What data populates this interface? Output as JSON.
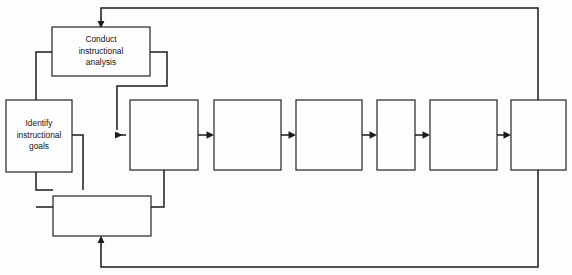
{
  "diagram": {
    "type": "instructional-design-flowchart",
    "background_color": "#fdfdfb",
    "line_color": "#1b1b1b",
    "box_fill_color": "#fefefe",
    "nodes": [
      {
        "id": "conduct-instructional-analysis",
        "label_lines": [
          "Conduct",
          "instructional",
          "analysis"
        ],
        "line1": "Conduct",
        "line2": "instructional",
        "line3": "analysis",
        "x": 52,
        "y": 27,
        "width": 98,
        "height": 49
      },
      {
        "id": "identify-instructional-goals",
        "label_lines": [
          "Identify",
          "instructional",
          "goals"
        ],
        "line1": "Identify",
        "line2": "instructional",
        "line3": "goals",
        "x": 6,
        "y": 100,
        "width": 66,
        "height": 72
      },
      {
        "id": "bottom-box",
        "label_lines": [],
        "line1": "",
        "x": 53,
        "y": 196,
        "width": 98,
        "height": 40
      },
      {
        "id": "process-step-1",
        "label_lines": [],
        "line1": "",
        "x": 130,
        "y": 100,
        "width": 68,
        "height": 70
      },
      {
        "id": "process-step-2",
        "label_lines": [],
        "line1": "",
        "x": 214,
        "y": 100,
        "width": 67,
        "height": 70
      },
      {
        "id": "process-step-3",
        "label_lines": [],
        "line1": "",
        "x": 296,
        "y": 100,
        "width": 66,
        "height": 70
      },
      {
        "id": "process-step-4",
        "label_lines": [],
        "line1": "",
        "x": 377,
        "y": 100,
        "width": 38,
        "height": 70
      },
      {
        "id": "process-step-5",
        "label_lines": [],
        "line1": "",
        "x": 430,
        "y": 100,
        "width": 67,
        "height": 70
      },
      {
        "id": "process-step-6",
        "label_lines": [],
        "line1": "",
        "x": 511,
        "y": 100,
        "width": 55,
        "height": 70
      }
    ],
    "connectors": [
      {
        "id": "top-feedback-loop",
        "from": "process-step-6",
        "to": "conduct-instructional-analysis",
        "direction": "up-left-down",
        "arrow": true
      },
      {
        "id": "bottom-feedback-loop",
        "from": "process-step-6",
        "to": "bottom-box",
        "direction": "down-left-up",
        "arrow": true
      },
      {
        "id": "conduct-to-step-1",
        "from": "conduct-instructional-analysis",
        "to": "process-step-1",
        "arrow": true
      },
      {
        "id": "conduct-to-identify",
        "from": "conduct-instructional-analysis",
        "to": "identify-instructional-goals",
        "arrow": false
      },
      {
        "id": "identify-to-step-1",
        "from": "identify-instructional-goals",
        "to": "process-step-1",
        "arrow": true
      },
      {
        "id": "identify-to-bottom-box",
        "from": "identify-instructional-goals",
        "to": "bottom-box",
        "arrow": false
      },
      {
        "id": "step-1-to-bottom-box",
        "from": "process-step-1",
        "to": "bottom-box",
        "arrow": false
      },
      {
        "id": "step-1-to-step-2",
        "from": "process-step-1",
        "to": "process-step-2",
        "arrow": true
      },
      {
        "id": "step-2-to-step-3",
        "from": "process-step-2",
        "to": "process-step-3",
        "arrow": true
      },
      {
        "id": "step-3-to-step-4",
        "from": "process-step-3",
        "to": "process-step-4",
        "arrow": true
      },
      {
        "id": "step-4-to-step-5",
        "from": "process-step-4",
        "to": "process-step-5",
        "arrow": true
      },
      {
        "id": "step-5-to-step-6",
        "from": "process-step-5",
        "to": "process-step-6",
        "arrow": true
      }
    ]
  }
}
